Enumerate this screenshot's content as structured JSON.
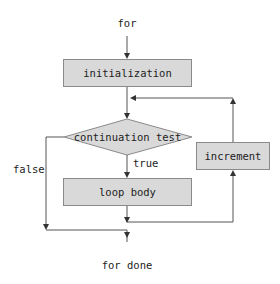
{
  "diagram": {
    "type": "flowchart",
    "colors": {
      "node_fill": "#d9d9d9",
      "node_stroke": "#8a8a8a",
      "edge": "#555555",
      "text": "#222222"
    },
    "start_label": "for",
    "end_label": "for done",
    "nodes": {
      "initialization": {
        "label": "initialization",
        "shape": "rectangle"
      },
      "condition": {
        "label": "continuation test",
        "shape": "diamond"
      },
      "body": {
        "label": "loop body",
        "shape": "rectangle"
      },
      "increment": {
        "label": "increment",
        "shape": "rectangle"
      }
    },
    "edge_labels": {
      "true": "true",
      "false": "false"
    },
    "edges": [
      {
        "from": "for",
        "to": "initialization"
      },
      {
        "from": "initialization",
        "to": "condition"
      },
      {
        "from": "condition",
        "to": "body",
        "label": "true"
      },
      {
        "from": "condition",
        "to": "for done",
        "label": "false"
      },
      {
        "from": "body",
        "to": "increment"
      },
      {
        "from": "increment",
        "to": "condition"
      }
    ]
  }
}
